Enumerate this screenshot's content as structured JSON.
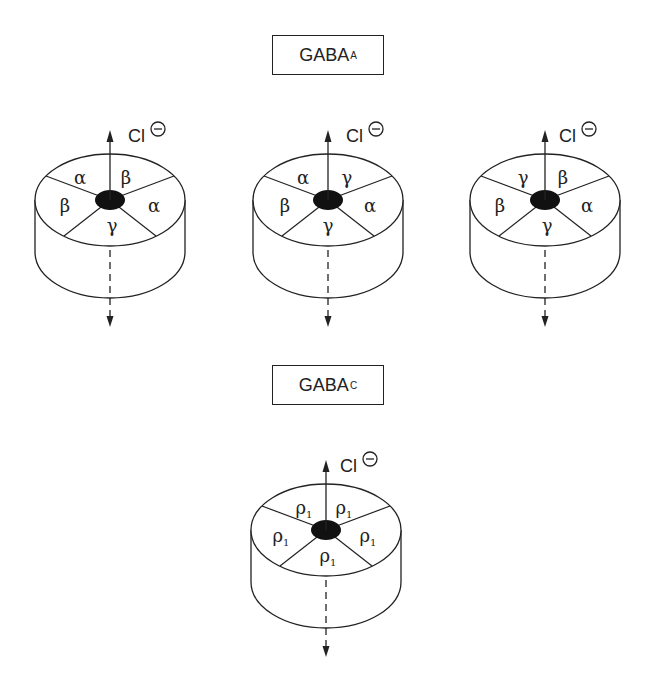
{
  "diagram": {
    "groups": [
      {
        "title": "GABA",
        "subscript": "A",
        "receptors": [
          {
            "ion": "Cl",
            "ion_charge": "−",
            "subunits": {
              "top_left": "α",
              "top_right": "β",
              "left": "β",
              "right": "α",
              "bottom": "γ"
            }
          },
          {
            "ion": "Cl",
            "ion_charge": "−",
            "subunits": {
              "top_left": "α",
              "top_right": "γ",
              "left": "β",
              "right": "α",
              "bottom": "γ"
            }
          },
          {
            "ion": "Cl",
            "ion_charge": "−",
            "subunits": {
              "top_left": "γ",
              "top_right": "β",
              "left": "β",
              "right": "α",
              "bottom": "γ"
            }
          }
        ]
      },
      {
        "title": "GABA",
        "subscript": "C",
        "receptors": [
          {
            "ion": "Cl",
            "ion_charge": "−",
            "subunits": {
              "top_left": "ρ1",
              "top_right": "ρ1",
              "left": "ρ1",
              "right": "ρ1",
              "bottom": "ρ1"
            }
          }
        ]
      }
    ],
    "colors": {
      "line": "#222222",
      "pore": "#111111",
      "background": "#ffffff"
    }
  }
}
